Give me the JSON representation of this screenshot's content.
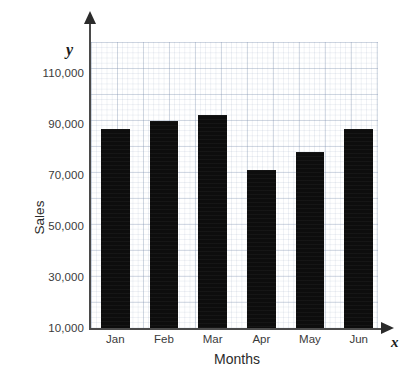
{
  "chart_data": {
    "type": "bar",
    "title": "",
    "xlabel": "Months",
    "ylabel": "Sales",
    "categories": [
      "Jan",
      "Feb",
      "Mar",
      "Apr",
      "May",
      "Jun"
    ],
    "values": [
      88400,
      91600,
      93900,
      72400,
      79400,
      88400
    ],
    "ylim": [
      10000,
      110000
    ],
    "ytick_labels": [
      "110,000",
      "90,000",
      "70,000",
      "50,000",
      "30,000",
      "10,000"
    ],
    "ytick_values": [
      110000,
      90000,
      70000,
      50000,
      30000,
      10000
    ],
    "grid": true,
    "legend": false,
    "legend_position": "none",
    "axis_variable_y": "y",
    "axis_variable_x": "x",
    "bar_color": "#0d0d0d",
    "grid_color": "#c9d3e0",
    "axis_color": "#4a4a4a",
    "text_color": "#3a3a3a"
  }
}
